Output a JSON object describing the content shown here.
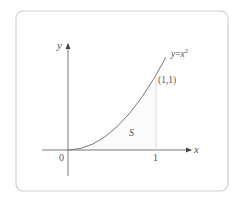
{
  "figure": {
    "curve_label_base": "y",
    "curve_label_eq": "=",
    "curve_label_x": "x",
    "curve_label_exp": "2",
    "point_label": "(1,1)",
    "region_label": "S",
    "origin_label": "0",
    "x_tick_label": "1",
    "x_axis_label": "x",
    "y_axis_label": "y"
  },
  "colors": {
    "frame": "#cfcfcf",
    "axis": "#6a6a6a",
    "curve": "#7a7a7a",
    "guide": "#d8d8d8",
    "text": "#555555"
  }
}
